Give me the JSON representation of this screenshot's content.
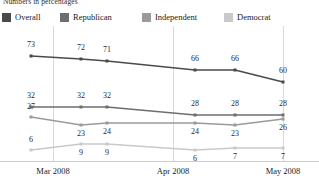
{
  "note": "Numbers in percentages",
  "legend": {
    "items": [
      {
        "label": "Overall",
        "color": "#4a4a4a"
      },
      {
        "label": "Republican",
        "color": "#6e6e6e"
      },
      {
        "label": "Independent",
        "color": "#9a9a9a"
      },
      {
        "label": "Democrat",
        "color": "#c9c9c9"
      }
    ]
  },
  "axis": {
    "ticks": [
      {
        "label": "Mar 2008",
        "x": 53
      },
      {
        "label": "Apr 2008",
        "x": 173
      },
      {
        "label": "May 2008",
        "x": 283
      }
    ]
  },
  "chart_data": {
    "type": "line",
    "title": "",
    "subtitle": "Numbers in percentages",
    "xlabel": "",
    "ylabel": "",
    "grid": true,
    "legend_position": "top",
    "ylim": [
      0,
      80
    ],
    "x": [
      1,
      2,
      3,
      4,
      5,
      6
    ],
    "categories": [
      "Mar 2008",
      "",
      "",
      "Apr 2008",
      "",
      "May 2008"
    ],
    "tick_labels": [
      "Mar 2008",
      "Apr 2008",
      "May 2008"
    ],
    "series": [
      {
        "name": "Overall",
        "color": "#4a4a4a",
        "values": [
          73,
          72,
          71,
          66,
          66,
          60
        ]
      },
      {
        "name": "Republican",
        "color": "#6e6e6e",
        "values": [
          32,
          32,
          32,
          28,
          28,
          28
        ]
      },
      {
        "name": "Independent",
        "color": "#9a9a9a",
        "values": [
          27,
          23,
          24,
          24,
          23,
          26
        ]
      },
      {
        "name": "Democrat",
        "color": "#c9c9c9",
        "values": [
          6,
          9,
          9,
          6,
          7,
          7
        ]
      }
    ],
    "point_px": {
      "x": [
        31,
        81,
        107,
        195,
        235,
        283
      ],
      "overall_y": [
        30,
        33,
        35,
        44,
        44,
        56
      ],
      "republican_y": [
        81,
        81,
        81,
        89,
        89,
        89
      ],
      "independent_y": [
        91,
        99,
        97,
        97,
        99,
        93
      ],
      "democrat_y": [
        124,
        118,
        118,
        124,
        122,
        122
      ]
    },
    "labels": {
      "Overall": [
        "73",
        "72",
        "71",
        "66",
        "66",
        "60"
      ],
      "Republican": [
        "32",
        "32",
        "32",
        "28",
        "28",
        "28"
      ],
      "Independent": [
        "27",
        "23",
        "24",
        "24",
        "23",
        "26"
      ],
      "Democrat": [
        "6",
        "9",
        "9",
        "6",
        "7",
        "7"
      ]
    }
  }
}
